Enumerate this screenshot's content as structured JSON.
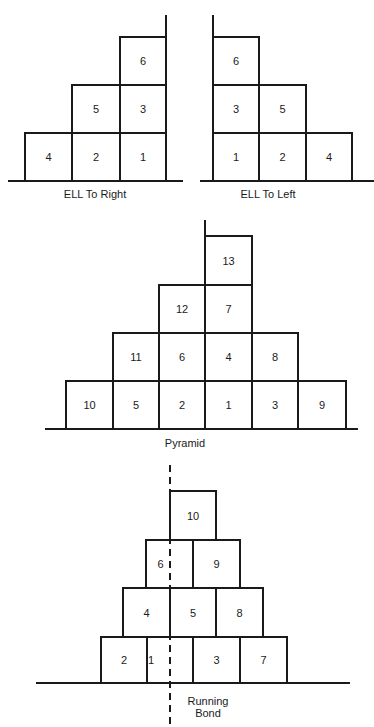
{
  "diagrams": [
    {
      "id": "ell-right",
      "caption": "ELL To Right",
      "ground": {
        "x1": 8,
        "x2": 183,
        "y": 181
      },
      "guide": {
        "x": 166,
        "y1": 15,
        "y2": 181,
        "dashed": false
      },
      "bricks": [
        {
          "label": "4",
          "x": 25,
          "y": 133,
          "w": 47,
          "h": 48
        },
        {
          "label": "2",
          "x": 72,
          "y": 133,
          "w": 48,
          "h": 48
        },
        {
          "label": "1",
          "x": 120,
          "y": 133,
          "w": 46,
          "h": 48
        },
        {
          "label": "5",
          "x": 72,
          "y": 85,
          "w": 48,
          "h": 48
        },
        {
          "label": "3",
          "x": 120,
          "y": 85,
          "w": 46,
          "h": 48
        },
        {
          "label": "6",
          "x": 120,
          "y": 37,
          "w": 46,
          "h": 48
        }
      ],
      "caption_pos": {
        "x": 45,
        "y": 188,
        "w": 100
      }
    },
    {
      "id": "ell-left",
      "caption": "ELL  To  Left",
      "ground": {
        "x1": 200,
        "x2": 374,
        "y": 181
      },
      "guide": {
        "x": 213,
        "y1": 15,
        "y2": 181,
        "dashed": false
      },
      "bricks": [
        {
          "label": "1",
          "x": 213,
          "y": 133,
          "w": 46,
          "h": 48
        },
        {
          "label": "2",
          "x": 259,
          "y": 133,
          "w": 47,
          "h": 48
        },
        {
          "label": "4",
          "x": 306,
          "y": 133,
          "w": 46,
          "h": 48
        },
        {
          "label": "3",
          "x": 213,
          "y": 85,
          "w": 46,
          "h": 48
        },
        {
          "label": "5",
          "x": 259,
          "y": 85,
          "w": 47,
          "h": 48
        },
        {
          "label": "6",
          "x": 213,
          "y": 37,
          "w": 46,
          "h": 48
        }
      ],
      "caption_pos": {
        "x": 218,
        "y": 188,
        "w": 100
      }
    },
    {
      "id": "pyramid",
      "caption": "Pyramid",
      "ground": {
        "x1": 45,
        "x2": 358,
        "y": 429
      },
      "guide": {
        "x": 205,
        "y1": 220,
        "y2": 236,
        "dashed": false
      },
      "bricks": [
        {
          "label": "10",
          "x": 66,
          "y": 381,
          "w": 47,
          "h": 48
        },
        {
          "label": "5",
          "x": 113,
          "y": 381,
          "w": 46,
          "h": 48
        },
        {
          "label": "2",
          "x": 159,
          "y": 381,
          "w": 46,
          "h": 48
        },
        {
          "label": "1",
          "x": 205,
          "y": 381,
          "w": 47,
          "h": 48
        },
        {
          "label": "3",
          "x": 252,
          "y": 381,
          "w": 46,
          "h": 48
        },
        {
          "label": "9",
          "x": 298,
          "y": 381,
          "w": 48,
          "h": 48
        },
        {
          "label": "11",
          "x": 113,
          "y": 333,
          "w": 46,
          "h": 48
        },
        {
          "label": "6",
          "x": 159,
          "y": 333,
          "w": 46,
          "h": 48
        },
        {
          "label": "4",
          "x": 205,
          "y": 333,
          "w": 47,
          "h": 48
        },
        {
          "label": "8",
          "x": 252,
          "y": 333,
          "w": 46,
          "h": 48
        },
        {
          "label": "12",
          "x": 159,
          "y": 285,
          "w": 46,
          "h": 48
        },
        {
          "label": "7",
          "x": 205,
          "y": 285,
          "w": 47,
          "h": 48
        },
        {
          "label": "13",
          "x": 205,
          "y": 236,
          "w": 47,
          "h": 49
        }
      ],
      "caption_pos": {
        "x": 135,
        "y": 437,
        "w": 100
      }
    },
    {
      "id": "running-bond",
      "caption": "Running\nBond",
      "caption_lines": [
        "Running",
        "Bond"
      ],
      "ground": {
        "x1": 36,
        "x2": 350,
        "y": 683
      },
      "guide": {
        "x": 170,
        "y1": 465,
        "y2": 725,
        "dashed": true
      },
      "bricks": [
        {
          "label": "2",
          "x": 101,
          "y": 637,
          "w": 46,
          "h": 46
        },
        {
          "label": "1",
          "x": 147,
          "y": 637,
          "w": 46,
          "h": 46,
          "label_dx": -19
        },
        {
          "label": "3",
          "x": 193,
          "y": 637,
          "w": 47,
          "h": 46
        },
        {
          "label": "7",
          "x": 240,
          "y": 637,
          "w": 47,
          "h": 46
        },
        {
          "label": "4",
          "x": 123,
          "y": 588,
          "w": 47,
          "h": 49
        },
        {
          "label": "5",
          "x": 170,
          "y": 588,
          "w": 46,
          "h": 49
        },
        {
          "label": "8",
          "x": 216,
          "y": 588,
          "w": 47,
          "h": 49
        },
        {
          "label": "6",
          "x": 146,
          "y": 540,
          "w": 47,
          "h": 48,
          "label_dx": -9
        },
        {
          "label": "9",
          "x": 193,
          "y": 540,
          "w": 47,
          "h": 48
        },
        {
          "label": "10",
          "x": 170,
          "y": 491,
          "w": 46,
          "h": 49
        }
      ],
      "caption_pos": {
        "x": 178,
        "y": 695,
        "w": 60
      }
    }
  ],
  "style": {
    "stroke": "#1a1a1a",
    "stroke_width": 2,
    "background": "#ffffff"
  }
}
